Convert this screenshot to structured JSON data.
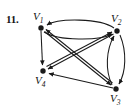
{
  "figure": {
    "problem_number": "11.",
    "type": "directed-graph",
    "background_color": "#ffffff",
    "stroke_color": "#1a1a1a",
    "width": 133,
    "height": 109
  },
  "vertices": [
    {
      "id": "v1",
      "label": "V",
      "subscript": "1",
      "x": 41,
      "y": 28,
      "radius": 2.6
    },
    {
      "id": "v2",
      "label": "V",
      "subscript": "2",
      "x": 117,
      "y": 31,
      "radius": 2.6
    },
    {
      "id": "v3",
      "label": "V",
      "subscript": "3",
      "x": 116,
      "y": 89,
      "radius": 2.6
    },
    {
      "id": "v4",
      "label": "V",
      "subscript": "4",
      "x": 43,
      "y": 71,
      "radius": 2.6
    }
  ],
  "edges": [
    {
      "id": "e-v2-v1-curve",
      "from": "v2",
      "to": "v1",
      "style": "curved-top",
      "arrow_at": "v1"
    },
    {
      "id": "e-v1-v2-curve",
      "from": "v1",
      "to": "v2",
      "style": "curved-inner",
      "arrow_at": "v2"
    },
    {
      "id": "e-v2-v3-curve",
      "from": "v2",
      "to": "v3",
      "style": "curved-right-outer",
      "arrow_at": "v3"
    },
    {
      "id": "e-v3-v2-curve",
      "from": "v3",
      "to": "v2",
      "style": "curved-right-inner",
      "arrow_at": "v2"
    },
    {
      "id": "e-v1-v4",
      "from": "v1",
      "to": "v4",
      "style": "straight",
      "arrow_at": "v4"
    },
    {
      "id": "e-v3-v4",
      "from": "v3",
      "to": "v4",
      "style": "straight",
      "arrow_at": "v4"
    },
    {
      "id": "e-v1-v3",
      "from": "v1",
      "to": "v3",
      "style": "diagonal-double",
      "arrow_at": "v3"
    },
    {
      "id": "e-v3-v1",
      "from": "v3",
      "to": "v1",
      "style": "diagonal-double",
      "arrow_at": "v1"
    },
    {
      "id": "e-v2-v4",
      "from": "v2",
      "to": "v4",
      "style": "diagonal-double",
      "arrow_at": "v4"
    },
    {
      "id": "e-v4-v2",
      "from": "v4",
      "to": "v2",
      "style": "diagonal-double",
      "arrow_at": "v2"
    }
  ]
}
